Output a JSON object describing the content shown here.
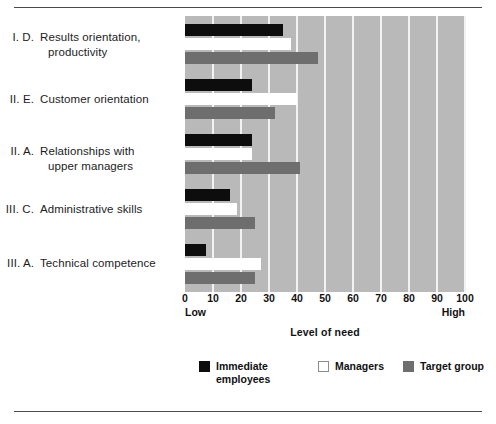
{
  "chart_data": {
    "type": "bar",
    "orientation": "horizontal",
    "title": "",
    "xlabel": "Level of need",
    "ylabel": "",
    "xlim": [
      0,
      100
    ],
    "xticks": [
      0,
      10,
      20,
      30,
      40,
      50,
      60,
      70,
      80,
      90,
      100
    ],
    "xtick_labels": [
      "0",
      "10",
      "20",
      "30",
      "40",
      "50",
      "60",
      "70",
      "80",
      "90",
      "100"
    ],
    "axis_endpoint_labels": {
      "low": "Low",
      "high": "High"
    },
    "grid": true,
    "legend_position": "bottom",
    "categories": [
      "I.  D.  Results orientation, productivity",
      "II.  E.  Customer orientation",
      "II.  A.  Relationships with upper managers",
      "III.  C.  Administrative skills",
      "III.  A.  Technical competence"
    ],
    "category_parts": [
      {
        "num": "I.  D.",
        "line1": "Results orientation,",
        "line2": "productivity"
      },
      {
        "num": "II.  E.",
        "line1": "Customer orientation",
        "line2": ""
      },
      {
        "num": "II.  A.",
        "line1": "Relationships with",
        "line2": "upper managers"
      },
      {
        "num": "III.  C.",
        "line1": "Administrative skills",
        "line2": ""
      },
      {
        "num": "III.  A.",
        "line1": "Technical competence",
        "line2": ""
      }
    ],
    "series": [
      {
        "name": "Immediate employees",
        "color": "#0d0d0d",
        "values": [
          35,
          24,
          24,
          16,
          7.5
        ]
      },
      {
        "name": "Managers",
        "color": "#ffffff",
        "values": [
          38,
          40,
          24,
          18.5,
          27
        ]
      },
      {
        "name": "Target group",
        "color": "#6e6e6e",
        "values": [
          47.5,
          32,
          41,
          25,
          25
        ]
      }
    ]
  },
  "legend": {
    "items": [
      {
        "label": "Immediate\nemployees",
        "swatch": "black"
      },
      {
        "label": "Managers",
        "swatch": "white"
      },
      {
        "label": "Target group",
        "swatch": "gray"
      }
    ]
  },
  "colors": {
    "plot_background": "#b9b9b9",
    "gridline": "#f2f2f2",
    "rule": "#4a4a4a",
    "series_immediate_employees": "#0d0d0d",
    "series_managers": "#ffffff",
    "series_target_group": "#6e6e6e"
  }
}
